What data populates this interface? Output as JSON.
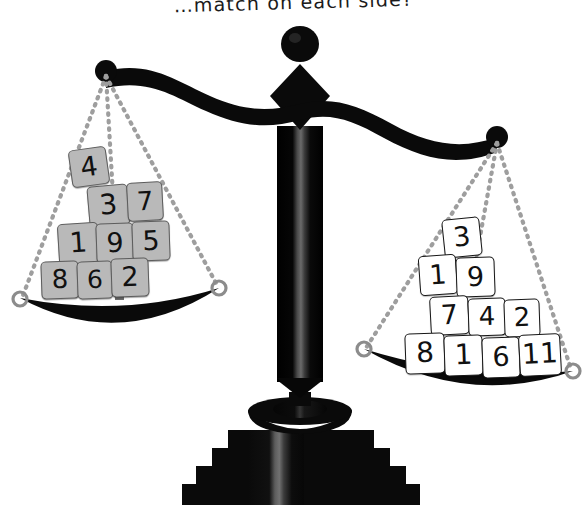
{
  "page": {
    "title_text": "…match on each side?",
    "background_color": "#ffffff"
  },
  "scale": {
    "name": "balance-scale",
    "state": "tilted-left",
    "colors": {
      "frame": "#0a0a0a",
      "highlight": "#555555",
      "string": "#9a9a9a",
      "ring": "#8c8c8c"
    },
    "beam": {
      "left_pivot": {
        "x": 106,
        "y": 71
      },
      "right_pivot": {
        "x": 497,
        "y": 137
      },
      "fulcrum": {
        "x": 300,
        "y": 116
      }
    },
    "left_pan": {
      "label": "left-pan",
      "left_anchor": {
        "x": 20,
        "y": 300
      },
      "right_anchor": {
        "x": 219,
        "y": 288
      }
    },
    "right_pan": {
      "label": "right-pan",
      "left_anchor": {
        "x": 364,
        "y": 349
      },
      "right_anchor": {
        "x": 573,
        "y": 371
      }
    }
  },
  "left_tray": {
    "label": "left-tray-tiles",
    "tile_color": "#b9b9b9",
    "rows": [
      {
        "row": 1,
        "values": [
          4
        ]
      },
      {
        "row": 2,
        "values": [
          3,
          7
        ]
      },
      {
        "row": 3,
        "values": [
          1,
          9,
          5
        ]
      },
      {
        "row": 4,
        "values": [
          8,
          6,
          2
        ]
      }
    ],
    "tiles": [
      {
        "value": "4",
        "x": 70,
        "y": 148,
        "w": 38,
        "h": 38,
        "rot": -8,
        "fs": 27
      },
      {
        "value": "3",
        "x": 88,
        "y": 185,
        "w": 41,
        "h": 41,
        "rot": -5,
        "fs": 28
      },
      {
        "value": "7",
        "x": 127,
        "y": 182,
        "w": 36,
        "h": 39,
        "rot": -3,
        "fs": 26
      },
      {
        "value": "1",
        "x": 58,
        "y": 223,
        "w": 41,
        "h": 41,
        "rot": -3.5,
        "fs": 28
      },
      {
        "value": "9",
        "x": 96,
        "y": 223,
        "w": 38,
        "h": 40,
        "rot": -2,
        "fs": 27
      },
      {
        "value": "5",
        "x": 132,
        "y": 221,
        "w": 38,
        "h": 40,
        "rot": -2,
        "fs": 27
      },
      {
        "value": "8",
        "x": 41,
        "y": 261,
        "w": 38,
        "h": 38,
        "rot": -2,
        "fs": 26
      },
      {
        "value": "6",
        "x": 77,
        "y": 261,
        "w": 36,
        "h": 38,
        "rot": -2,
        "fs": 25
      },
      {
        "value": "2",
        "x": 111,
        "y": 258,
        "w": 38,
        "h": 39,
        "rot": -2,
        "fs": 27
      }
    ]
  },
  "right_tray": {
    "label": "right-tray-tiles",
    "tile_color": "#ffffff",
    "rows": [
      {
        "row": 1,
        "values": [
          3
        ]
      },
      {
        "row": 2,
        "values": [
          1,
          9
        ]
      },
      {
        "row": 3,
        "values": [
          7,
          4,
          2
        ]
      },
      {
        "row": 4,
        "values": [
          8,
          1,
          6,
          11
        ]
      }
    ],
    "tiles": [
      {
        "value": "3",
        "x": 443,
        "y": 218,
        "w": 38,
        "h": 39,
        "rot": -6,
        "fs": 27
      },
      {
        "value": "1",
        "x": 419,
        "y": 255,
        "w": 38,
        "h": 40,
        "rot": -4,
        "fs": 27
      },
      {
        "value": "9",
        "x": 456,
        "y": 257,
        "w": 39,
        "h": 40,
        "rot": -2,
        "fs": 27
      },
      {
        "value": "7",
        "x": 430,
        "y": 296,
        "w": 39,
        "h": 39,
        "rot": -3,
        "fs": 27
      },
      {
        "value": "4",
        "x": 468,
        "y": 298,
        "w": 38,
        "h": 38,
        "rot": -2,
        "fs": 26
      },
      {
        "value": "2",
        "x": 504,
        "y": 299,
        "w": 36,
        "h": 38,
        "rot": -2,
        "fs": 26
      },
      {
        "value": "8",
        "x": 405,
        "y": 333,
        "w": 40,
        "h": 41,
        "rot": -2,
        "fs": 28
      },
      {
        "value": "1",
        "x": 444,
        "y": 335,
        "w": 39,
        "h": 41,
        "rot": -2,
        "fs": 28
      },
      {
        "value": "6",
        "x": 482,
        "y": 337,
        "w": 38,
        "h": 41,
        "rot": -2,
        "fs": 27
      },
      {
        "value": "11",
        "x": 519,
        "y": 334,
        "w": 42,
        "h": 42,
        "rot": -3,
        "fs": 28
      }
    ]
  }
}
